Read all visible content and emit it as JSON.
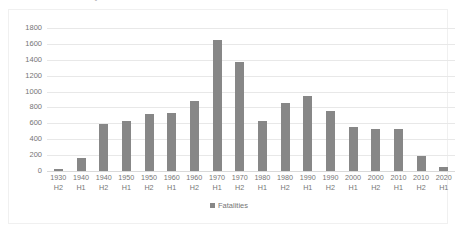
{
  "chart_data": {
    "type": "bar",
    "title": "",
    "xlabel": "",
    "ylabel": "",
    "ylim": [
      0,
      1800
    ],
    "ytick_step": 200,
    "grid": true,
    "legend_position": "bottom",
    "series_name": "Fatalities",
    "bar_color": "#878787",
    "categories": [
      "1930 H2",
      "1940 H1",
      "1940 H2",
      "1950 H1",
      "1950 H2",
      "1960 H1",
      "1960 H2",
      "1970 H1",
      "1970 H2",
      "1980 H1",
      "1980 H2",
      "1990 H1",
      "1990 H2",
      "2000 H1",
      "2000 H2",
      "2010 H1",
      "2010 H2",
      "2020 H1"
    ],
    "category_lines": [
      {
        "year": "1930",
        "half": "H2"
      },
      {
        "year": "1940",
        "half": "H1"
      },
      {
        "year": "1940",
        "half": "H2"
      },
      {
        "year": "1950",
        "half": "H1"
      },
      {
        "year": "1950",
        "half": "H2"
      },
      {
        "year": "1960",
        "half": "H1"
      },
      {
        "year": "1960",
        "half": "H2"
      },
      {
        "year": "1970",
        "half": "H1"
      },
      {
        "year": "1970",
        "half": "H2"
      },
      {
        "year": "1980",
        "half": "H1"
      },
      {
        "year": "1980",
        "half": "H2"
      },
      {
        "year": "1990",
        "half": "H1"
      },
      {
        "year": "1990",
        "half": "H2"
      },
      {
        "year": "2000",
        "half": "H1"
      },
      {
        "year": "2000",
        "half": "H2"
      },
      {
        "year": "2010",
        "half": "H1"
      },
      {
        "year": "2010",
        "half": "H2"
      },
      {
        "year": "2020",
        "half": "H1"
      }
    ],
    "values": [
      25,
      160,
      590,
      625,
      720,
      725,
      880,
      1650,
      1375,
      635,
      855,
      940,
      760,
      560,
      530,
      535,
      195,
      55
    ],
    "ytick_labels": [
      "1800",
      "1600",
      "1400",
      "1200",
      "1000",
      "800",
      "600",
      "400",
      "200",
      "0"
    ],
    "ytick_values": [
      1800,
      1600,
      1400,
      1200,
      1000,
      800,
      600,
      400,
      200,
      0
    ]
  },
  "legend": {
    "series_label": "Fatalities"
  },
  "title_remnant": {
    "text": "Fatalities in major aviation accidents"
  }
}
